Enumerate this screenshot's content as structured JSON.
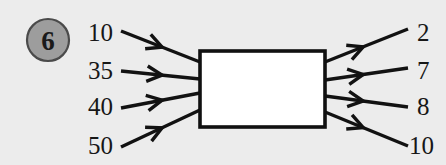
{
  "figure": {
    "background_color": "#ececec",
    "badge": {
      "label": "6",
      "fill_color": "#9d9d9d",
      "stroke_color": "#4a4a4a",
      "cx": 48,
      "cy": 40,
      "r": 21
    },
    "process_box": {
      "fill_color": "#ffffff",
      "stroke_color": "#101010",
      "x": 200,
      "y": 51,
      "width": 125,
      "height": 76
    },
    "line_color": "#121212",
    "inputs": [
      {
        "label": "10",
        "label_x": 88,
        "label_y": 41,
        "start_x": 121,
        "start_y": 31,
        "end_x": 200,
        "end_y": 62
      },
      {
        "label": "35",
        "label_x": 88,
        "label_y": 79,
        "start_x": 121,
        "start_y": 71,
        "end_x": 200,
        "end_y": 79
      },
      {
        "label": "40",
        "label_x": 88,
        "label_y": 115,
        "start_x": 121,
        "start_y": 108,
        "end_x": 200,
        "end_y": 93
      },
      {
        "label": "50",
        "label_x": 88,
        "label_y": 154,
        "start_x": 121,
        "start_y": 147,
        "end_x": 200,
        "end_y": 110
      }
    ],
    "outputs": [
      {
        "label": "2",
        "label_x": 417,
        "label_y": 41,
        "start_x": 325,
        "start_y": 62,
        "end_x": 408,
        "end_y": 29
      },
      {
        "label": "7",
        "label_x": 417,
        "label_y": 79,
        "start_x": 325,
        "start_y": 80,
        "end_x": 408,
        "end_y": 68
      },
      {
        "label": "8",
        "label_x": 417,
        "label_y": 115,
        "start_x": 325,
        "start_y": 96,
        "end_x": 408,
        "end_y": 107
      },
      {
        "label": "10",
        "label_x": 409,
        "label_y": 154,
        "start_x": 325,
        "start_y": 112,
        "end_x": 408,
        "end_y": 146
      }
    ]
  }
}
